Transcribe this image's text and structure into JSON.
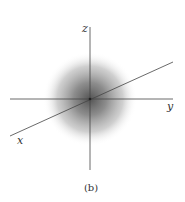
{
  "figure": {
    "caption": "(b)",
    "axes": {
      "z": {
        "label": "z"
      },
      "y": {
        "label": "y"
      },
      "x": {
        "label": "x"
      }
    },
    "blob": {
      "description": "spherically symmetric gray density cloud centered at origin",
      "center_color": "#555555",
      "edge_color": "#ffffff"
    },
    "colors": {
      "axis": "#444444",
      "text": "#333333",
      "background": "#ffffff"
    }
  }
}
